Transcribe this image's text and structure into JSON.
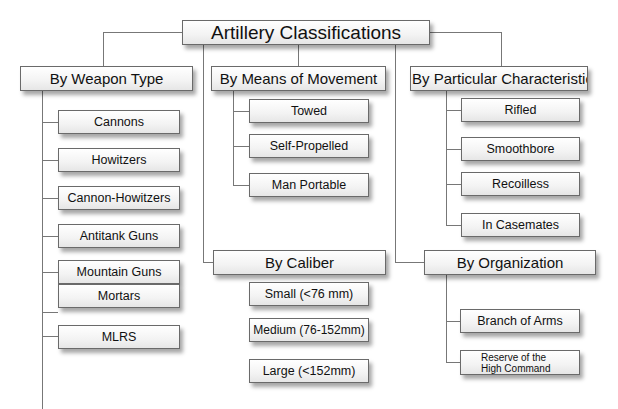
{
  "title": "Artillery Classifications",
  "categories": {
    "weapon_type": {
      "label": "By Weapon Type",
      "items": [
        "Cannons",
        "Howitzers",
        "Cannon-Howitzers",
        "Antitank Guns",
        "Mountain Guns",
        "Mortars",
        "MLRS"
      ]
    },
    "movement": {
      "label": "By Means of Movement",
      "items": [
        "Towed",
        "Self-Propelled",
        "Man Portable"
      ]
    },
    "characteristic": {
      "label": "By Particular Characteristic",
      "items": [
        "Rifled",
        "Smoothbore",
        "Recoilless",
        "In Casemates"
      ]
    },
    "caliber": {
      "label": "By Caliber",
      "items": [
        "Small (<76 mm)",
        "Medium (76-152mm)",
        "Large (<152mm)"
      ]
    },
    "organization": {
      "label": "By Organization",
      "items": [
        "Branch of Arms",
        "Reserve of the High Command"
      ]
    }
  }
}
